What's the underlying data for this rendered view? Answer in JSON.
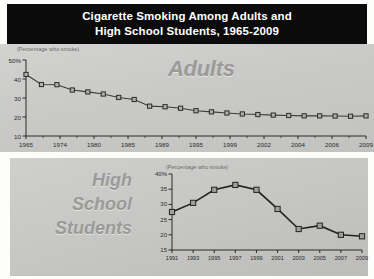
{
  "title": {
    "line1": "Cigarette Smoking Among Adults and",
    "line2": "High School Students, 1965-2009"
  },
  "colors": {
    "title_bar_bg": "#0b0b0b",
    "title_text": "#ffffff",
    "panel_bg": "#c9c9c7",
    "line": "#3a3a38",
    "marker_fill": "#b0b0ae",
    "marker_stroke": "#2b2b29",
    "big_label": "#9a9a98",
    "axis": "#2a2a28"
  },
  "adults_panel": {
    "series_label": "Adults",
    "axis_note": "(Percentage who smoke)"
  },
  "hs_panel": {
    "series_label_line1": "High",
    "series_label_line2": "School",
    "series_label_line3": "Students",
    "axis_note": "(Percentage who smoke)"
  },
  "chart_data": [
    {
      "type": "line",
      "title": "Cigarette Smoking Among Adults and High School Students, 1965-2009",
      "series_name": "Adults",
      "xlabel": "",
      "ylabel": "(Percentage who smoke)",
      "ylim": [
        10,
        50
      ],
      "yticks": [
        10,
        20,
        30,
        40,
        50
      ],
      "ytick_labels": [
        "10",
        "20",
        "30",
        "40",
        "50%"
      ],
      "grid": false,
      "legend": "none",
      "xlim": [
        1965,
        2009
      ],
      "xtick_labels": [
        "1965",
        "1974",
        "1980",
        "1985",
        "1989",
        "1995",
        "1999",
        "2002",
        "2004",
        "2006",
        "2009"
      ],
      "x": [
        1965,
        1974,
        1980,
        1985,
        1989,
        1995,
        1999,
        2002,
        2004,
        2006,
        2009
      ],
      "points": [
        {
          "x": 1965,
          "y": 42.4
        },
        {
          "x": 1974,
          "y": 37.1
        },
        {
          "x": 1980,
          "y": 37.0
        },
        {
          "x": 1985,
          "y": 34.2
        },
        {
          "x": 1989,
          "y": 33.2
        },
        {
          "x": 1995,
          "y": 32.1
        },
        {
          "x": 1999,
          "y": 30.3
        },
        {
          "x": 2002,
          "y": 29.2
        },
        {
          "x": 2004,
          "y": 25.7
        },
        {
          "x": 2006,
          "y": 25.4
        },
        {
          "x": 2009,
          "y": 24.6
        }
      ],
      "values": [
        42.4,
        37.1,
        37.0,
        34.2,
        33.2,
        32.1,
        30.3,
        29.2,
        25.7,
        25.4,
        24.6
      ],
      "dense_values": [
        42.4,
        37.1,
        37.0,
        34.2,
        33.2,
        32.1,
        30.3,
        29.2,
        25.7,
        25.4,
        24.6,
        23.3,
        22.7,
        22.1,
        21.6,
        21.3,
        21.0,
        20.8,
        20.6,
        20.6,
        20.5,
        20.4,
        20.6
      ]
    },
    {
      "type": "line",
      "series_name": "High School Students",
      "xlabel": "",
      "ylabel": "(Percentage who smoke)",
      "ylim": [
        15,
        40
      ],
      "yticks": [
        15,
        20,
        25,
        30,
        35,
        40
      ],
      "ytick_labels": [
        "15",
        "20",
        "25",
        "30",
        "35",
        "40%"
      ],
      "grid": false,
      "legend": "none",
      "xlim": [
        1991,
        2009
      ],
      "categories": [
        "1991",
        "1993",
        "1995",
        "1997",
        "1999",
        "2001",
        "2003",
        "2005",
        "2007",
        "2009"
      ],
      "x": [
        1991,
        1993,
        1995,
        1997,
        1999,
        2001,
        2003,
        2005,
        2007,
        2009
      ],
      "values": [
        27.5,
        30.5,
        34.8,
        36.4,
        34.8,
        28.5,
        21.9,
        23.0,
        20.0,
        19.5
      ],
      "points": [
        {
          "x": 1991,
          "y": 27.5
        },
        {
          "x": 1993,
          "y": 30.5
        },
        {
          "x": 1995,
          "y": 34.8
        },
        {
          "x": 1997,
          "y": 36.4
        },
        {
          "x": 1999,
          "y": 34.8
        },
        {
          "x": 2001,
          "y": 28.5
        },
        {
          "x": 2003,
          "y": 21.9
        },
        {
          "x": 2005,
          "y": 23.0
        },
        {
          "x": 2007,
          "y": 20.0
        },
        {
          "x": 2009,
          "y": 19.5
        }
      ]
    }
  ]
}
